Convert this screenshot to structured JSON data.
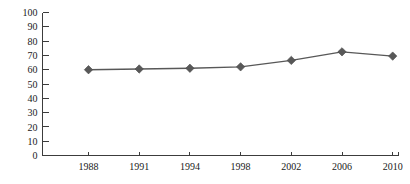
{
  "chart_data": {
    "type": "line",
    "title": "",
    "subtitle": "",
    "xlabel": "",
    "ylabel": "",
    "categories": [
      "1988",
      "1991",
      "1994",
      "1998",
      "2002",
      "2006",
      "2010"
    ],
    "values": [
      60,
      60.5,
      61,
      62,
      66.5,
      72.5,
      69.5
    ],
    "series": [
      {
        "name": "",
        "values": [
          60,
          60.5,
          61,
          62,
          66.5,
          72.5,
          69.5
        ]
      }
    ],
    "ylim": [
      0,
      100
    ],
    "y_ticks": [
      0,
      10,
      20,
      30,
      40,
      50,
      60,
      70,
      80,
      90,
      100
    ],
    "y_tick_labels": [
      "0",
      "10",
      "20",
      "30",
      "40",
      "50",
      "60",
      "70",
      "80",
      "90",
      "100"
    ],
    "x_tick_labels": [
      "1988",
      "1991",
      "1994",
      "1998",
      "2002",
      "2006",
      "2010"
    ],
    "grid": false,
    "legend": false,
    "legend_position": "none",
    "annotations": [],
    "marker": "diamond",
    "colors": {
      "line": "#585858",
      "marker": "#585858",
      "axis": "#3c3c3c",
      "text": "#1a1a1a",
      "background": "#ffffff"
    }
  }
}
